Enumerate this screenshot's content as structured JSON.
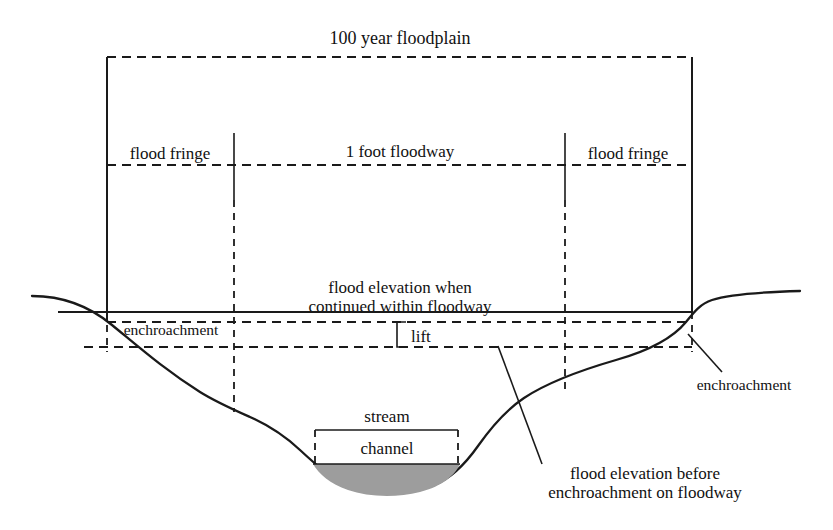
{
  "diagram": {
    "title": "100 year floodplain",
    "type": "floodplain cross-section",
    "zones": {
      "left_fringe": "flood fringe",
      "floodway": "1 foot  floodway",
      "right_fringe": "flood fringe"
    },
    "labels": {
      "left_encroachment": "enchroachment",
      "right_encroachment": "enchroachment",
      "lift": "lift",
      "flood_elev_when_line1": "flood elevation when",
      "flood_elev_when_line2": "continued within floodway",
      "flood_elev_before_line1": "flood elevation before",
      "flood_elev_before_line2": "enchroachment on floodway",
      "stream": "stream",
      "channel": "channel"
    },
    "colors": {
      "ink": "#1a1a1a",
      "water": "#9d9d9d",
      "background": "#ffffff"
    }
  }
}
